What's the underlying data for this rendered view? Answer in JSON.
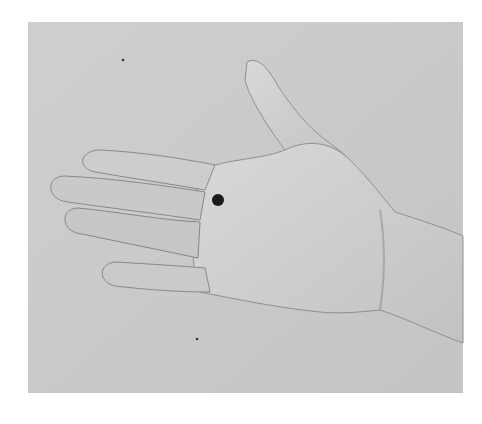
{
  "image": {
    "description": "Grayscale photograph of an open right-hand palm facing viewer, fingers pointing left, with a black dot marked on the palm near the base of the index/middle finger",
    "colors": {
      "background": "#c9c9c9",
      "skin": "#d2d2d2",
      "shadow": "#8a8a8a",
      "marker_dot": "#1a1a1a",
      "page": "#ffffff"
    },
    "marker": {
      "x": 218,
      "y": 200,
      "radius": 6
    }
  }
}
